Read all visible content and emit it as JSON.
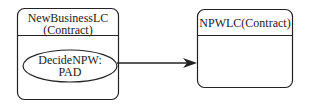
{
  "diagram": {
    "left_state": {
      "title_line1": "NewBusinessLC",
      "title_line2": "(Contract)",
      "activity_line1": "DecideNPW:",
      "activity_line2": "PAD"
    },
    "right_state": {
      "title": "NPWLC(Contract)"
    },
    "transition": {
      "from": "DecideNPW: PAD",
      "to": "NPWLC(Contract)"
    },
    "colors": {
      "stroke": "#222222",
      "fill": "#ffffff"
    }
  }
}
